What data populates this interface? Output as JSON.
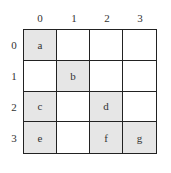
{
  "diagram": {
    "col_labels": [
      "0",
      "1",
      "2",
      "3"
    ],
    "row_labels": [
      "0",
      "1",
      "2",
      "3"
    ],
    "fill_color": "#e6e6e6",
    "cells": [
      [
        "a",
        "",
        "",
        ""
      ],
      [
        "",
        "b",
        "",
        ""
      ],
      [
        "c",
        "",
        "d",
        ""
      ],
      [
        "e",
        "",
        "f",
        "g"
      ]
    ],
    "filled": [
      [
        true,
        false,
        false,
        false
      ],
      [
        false,
        true,
        false,
        false
      ],
      [
        true,
        false,
        true,
        false
      ],
      [
        true,
        false,
        true,
        true
      ]
    ]
  }
}
